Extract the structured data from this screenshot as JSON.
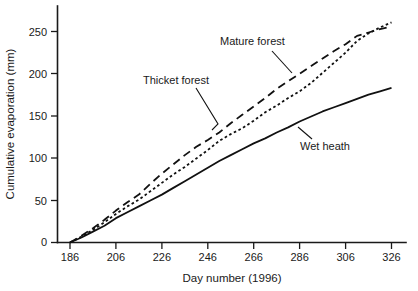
{
  "chart_data": {
    "type": "line",
    "title": "",
    "xlabel": "Day number (1996)",
    "ylabel": "Cumulative evaporation (mm)",
    "xlim": [
      186,
      326
    ],
    "ylim": [
      0,
      265
    ],
    "xticks": [
      186,
      206,
      226,
      246,
      266,
      286,
      306,
      326
    ],
    "yticks": [
      0,
      50,
      100,
      150,
      200,
      250
    ],
    "grid": false,
    "legend_position": "inline-annotations",
    "series": [
      {
        "name": "Mature forest",
        "style": "long-dashed",
        "x": [
          186,
          191,
          196,
          201,
          206,
          211,
          216,
          221,
          226,
          231,
          236,
          241,
          246,
          251,
          256,
          261,
          266,
          271,
          276,
          281,
          286,
          291,
          296,
          301,
          306,
          311,
          316,
          321,
          326
        ],
        "values": [
          0,
          8,
          17,
          27,
          38,
          48,
          57,
          70,
          82,
          93,
          104,
          114,
          122,
          131,
          142,
          152,
          162,
          172,
          183,
          192,
          201,
          210,
          219,
          228,
          236,
          246,
          250,
          254,
          257
        ]
      },
      {
        "name": "Thicket forest",
        "style": "short-dotted",
        "x": [
          186,
          191,
          196,
          201,
          206,
          211,
          216,
          221,
          226,
          231,
          236,
          241,
          246,
          251,
          256,
          261,
          266,
          271,
          276,
          281,
          286,
          291,
          296,
          301,
          306,
          311,
          316,
          321,
          326
        ],
        "values": [
          0,
          7,
          15,
          24,
          34,
          43,
          51,
          61,
          71,
          81,
          90,
          100,
          110,
          121,
          129,
          136,
          145,
          155,
          163,
          172,
          180,
          190,
          202,
          214,
          226,
          240,
          249,
          256,
          262
        ]
      },
      {
        "name": "Wet heath",
        "style": "solid",
        "x": [
          186,
          191,
          196,
          201,
          206,
          211,
          216,
          221,
          226,
          231,
          236,
          241,
          246,
          251,
          256,
          261,
          266,
          271,
          276,
          281,
          286,
          291,
          296,
          301,
          306,
          311,
          316,
          321,
          326
        ],
        "values": [
          0,
          6,
          13,
          20,
          29,
          36,
          43,
          50,
          57,
          65,
          73,
          81,
          89,
          97,
          104,
          111,
          118,
          124,
          131,
          137,
          144,
          150,
          156,
          161,
          166,
          171,
          176,
          180,
          184
        ]
      }
    ],
    "annotations": [
      {
        "text": "Mature forest",
        "target_series": "Mature forest"
      },
      {
        "text": "Thicket forest",
        "target_series": "Thicket forest"
      },
      {
        "text": "Wet heath",
        "target_series": "Wet heath"
      }
    ]
  }
}
